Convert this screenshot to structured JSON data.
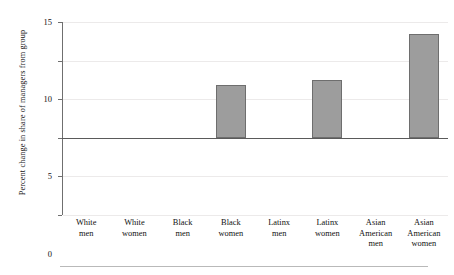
{
  "chart_data": {
    "type": "bar",
    "title": "",
    "xlabel": "",
    "ylabel": "Percent change in share of managers from group",
    "ylim": [
      -10,
      15
    ],
    "yticks": [
      "15",
      "10",
      "5",
      "0",
      "−5",
      "−10"
    ],
    "ytick_values": [
      15,
      10,
      5,
      0,
      -5,
      -10
    ],
    "grid": true,
    "legend": "none",
    "categories": [
      "White men",
      "White women",
      "Black men",
      "Black women",
      "Latinx men",
      "Latinx women",
      "Asian American men",
      "Asian American women"
    ],
    "category_lines": [
      [
        "White",
        "men"
      ],
      [
        "White",
        "women"
      ],
      [
        "Black",
        "men"
      ],
      [
        "Black",
        "women"
      ],
      [
        "Latinx",
        "men"
      ],
      [
        "Latinx",
        "women"
      ],
      [
        "Asian",
        "American",
        "men"
      ],
      [
        "Asian",
        "American",
        "women"
      ]
    ],
    "values": [
      0,
      0,
      0,
      6.8,
      0,
      7.5,
      0,
      13.4
    ],
    "bar_color": "#9d9d9d",
    "bar_edge_color": "#6e6e6e",
    "axis_color": "#5a5a5a",
    "grid_color": "#eceaea"
  }
}
